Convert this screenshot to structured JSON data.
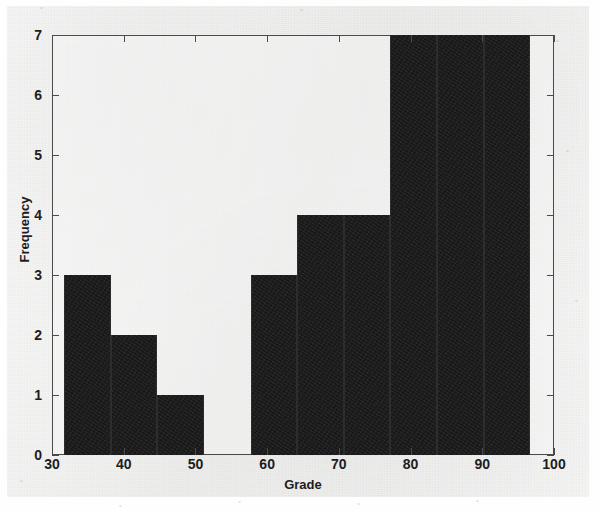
{
  "figure": {
    "background_color": "#f3f3f2",
    "axis_color": "#4a4a4a",
    "bar_color": "#191919"
  },
  "chart_data": {
    "type": "bar",
    "title": "",
    "xlabel": "Grade",
    "ylabel": "Frequency",
    "xlim": [
      30,
      100
    ],
    "ylim": [
      0,
      7
    ],
    "grid": false,
    "legend": null,
    "xticks": [
      30,
      40,
      50,
      60,
      70,
      80,
      90,
      100
    ],
    "xtick_labels": [
      "30",
      "40",
      "50",
      "60",
      "70",
      "80",
      "90",
      "100"
    ],
    "yticks": [
      0,
      1,
      2,
      3,
      4,
      5,
      6,
      7
    ],
    "ytick_labels": [
      "0",
      "1",
      "2",
      "3",
      "4",
      "5",
      "6",
      "7"
    ],
    "bin_edges": [
      31.7,
      38.2,
      44.7,
      51.2,
      57.7,
      64.2,
      70.7,
      77.2,
      83.7,
      90.2,
      96.7
    ],
    "bin_width": 6.5,
    "categories": [
      "31.7-38.2",
      "38.2-44.7",
      "44.7-51.2",
      "51.2-57.7",
      "57.7-64.2",
      "64.2-70.7",
      "70.7-77.2",
      "77.2-83.7",
      "83.7-90.2",
      "90.2-96.7"
    ],
    "values": [
      3,
      2,
      1,
      0,
      3,
      4,
      4,
      7,
      7,
      7
    ],
    "bars": [
      {
        "x0": 31.7,
        "x1": 38.2,
        "value": 3
      },
      {
        "x0": 38.2,
        "x1": 44.7,
        "value": 2
      },
      {
        "x0": 44.7,
        "x1": 51.2,
        "value": 1
      },
      {
        "x0": 51.2,
        "x1": 57.7,
        "value": 0
      },
      {
        "x0": 57.7,
        "x1": 64.2,
        "value": 3
      },
      {
        "x0": 64.2,
        "x1": 70.7,
        "value": 4
      },
      {
        "x0": 70.7,
        "x1": 77.2,
        "value": 4
      },
      {
        "x0": 77.2,
        "x1": 83.7,
        "value": 7
      },
      {
        "x0": 83.7,
        "x1": 90.2,
        "value": 7
      },
      {
        "x0": 90.2,
        "x1": 96.7,
        "value": 7
      }
    ]
  }
}
